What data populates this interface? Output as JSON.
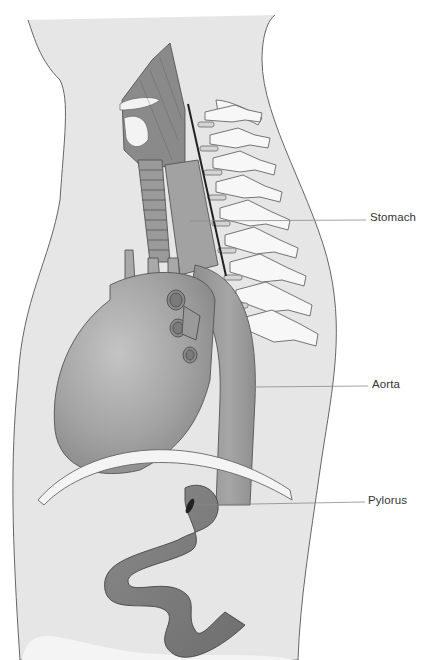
{
  "figure": {
    "type": "anatomical illustration",
    "view": "sagittal section of neck and thorax",
    "colors": {
      "background": "#ffffff",
      "body_fill": "#e6e6e6",
      "organ_dark": "#7c7c7c",
      "organ_mid": "#9a9a9a",
      "organ_light": "#bdbdbd",
      "bone": "#f7f7f7",
      "outline": "#555555",
      "leader_line": "#8a8a8a"
    }
  },
  "labels": [
    {
      "id": "stomach",
      "text": "Stomach"
    },
    {
      "id": "aorta",
      "text": "Aorta"
    },
    {
      "id": "pylorus",
      "text": "Pylorus"
    }
  ]
}
